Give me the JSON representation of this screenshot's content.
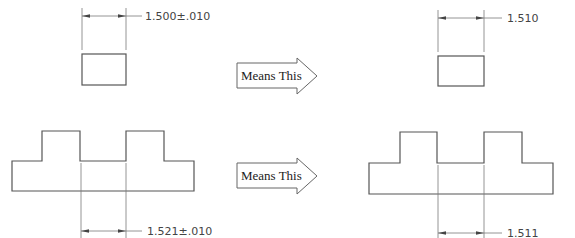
{
  "diagram": {
    "colors": {
      "background": "#ffffff",
      "outline": "#555555",
      "dimension_line": "#7a7a7a",
      "text": "#444444"
    },
    "top_row": {
      "original": {
        "shape": "rectangle",
        "dimension_label": "1.500±.010"
      },
      "arrow": {
        "label": "Means This"
      },
      "interpreted": {
        "shape": "rectangle",
        "dimension_label": "1.510"
      }
    },
    "bottom_row": {
      "original": {
        "shape": "stepped-profile-two-bosses",
        "dimension_label": "1.521±.010"
      },
      "arrow": {
        "label": "Means This"
      },
      "interpreted": {
        "shape": "stepped-profile-two-bosses",
        "dimension_label": "1.511"
      }
    }
  }
}
